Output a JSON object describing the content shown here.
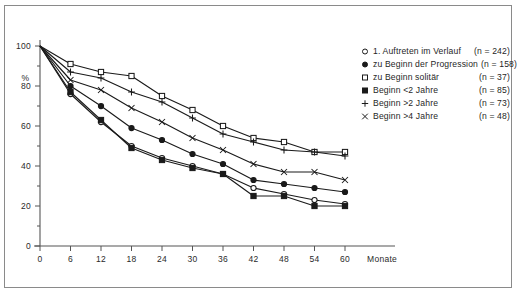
{
  "chart_data": {
    "type": "line",
    "title": "",
    "subtitle": "",
    "xlabel": "Monate",
    "ylabel": "%",
    "xlim": [
      0,
      60
    ],
    "ylim": [
      0,
      100
    ],
    "grid": false,
    "legend_position": "top-right",
    "x": [
      0,
      6,
      12,
      18,
      24,
      30,
      36,
      42,
      48,
      54,
      60
    ],
    "xticks": [
      "0",
      "6",
      "12",
      "18",
      "24",
      "30",
      "36",
      "42",
      "48",
      "54",
      "60"
    ],
    "yticks": [
      "0",
      "20",
      "40",
      "60",
      "80",
      "100"
    ],
    "series": [
      {
        "name": "1. Auftreten im Verlauf",
        "marker": "open-circle",
        "n_label": "(n = 242)",
        "n": 242,
        "values": [
          100,
          76,
          62,
          50,
          44,
          40,
          36,
          29,
          26,
          23,
          21
        ]
      },
      {
        "name": "zu Beginn der Progression",
        "marker": "solid-circle",
        "n_label": "(n = 158)",
        "n": 158,
        "values": [
          100,
          80,
          70,
          59,
          53,
          46,
          41,
          33,
          31,
          29,
          27
        ]
      },
      {
        "name": "zu Beginn solitär",
        "marker": "open-square",
        "n_label": "(n =  37)",
        "n": 37,
        "values": [
          100,
          91,
          87,
          85,
          75,
          68,
          60,
          54,
          52,
          47,
          47
        ]
      },
      {
        "name": "Beginn <2 Jahre",
        "marker": "solid-square",
        "n_label": "(n =  85)",
        "n": 85,
        "values": [
          100,
          77,
          63,
          49,
          43,
          39,
          36,
          25,
          25,
          20,
          20
        ]
      },
      {
        "name": "Beginn >2 Jahre",
        "marker": "plus",
        "n_label": "(n =  73)",
        "n": 73,
        "values": [
          100,
          87,
          84,
          77,
          72,
          64,
          56,
          52,
          48,
          47,
          45
        ]
      },
      {
        "name": "Beginn >4 Jahre",
        "marker": "cross",
        "n_label": "(n =  48)",
        "n": 48,
        "values": [
          100,
          83,
          78,
          69,
          62,
          54,
          48,
          41,
          37,
          37,
          33
        ]
      }
    ]
  },
  "axes": {
    "y_unit_label": "%",
    "x_axis_name": "Monate"
  }
}
